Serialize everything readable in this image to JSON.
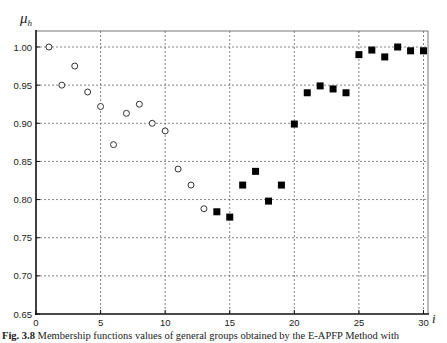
{
  "figure": {
    "caption_label": "Fig. 3.8",
    "caption_text": " Membership functions values of general groups obtained by the E-APFP Method with"
  },
  "chart_data": {
    "type": "scatter",
    "title": "",
    "xlabel": "i",
    "ylabel": "μ",
    "ylabel_subscript": "h",
    "xlim": [
      0,
      30
    ],
    "ylim": [
      0.65,
      1.0
    ],
    "x_ticks": [
      0,
      5,
      10,
      15,
      20,
      25,
      30
    ],
    "x_tick_labels": [
      "0",
      "5",
      "10",
      "15",
      "20",
      "25",
      "30"
    ],
    "y_ticks": [
      0.65,
      0.7,
      0.75,
      0.8,
      0.85,
      0.9,
      0.95,
      1.0
    ],
    "y_tick_labels": [
      "0.65",
      "0.70",
      "0.75",
      "0.80",
      "0.85",
      "0.90",
      "0.95",
      "1.00"
    ],
    "grid": true,
    "legend": null,
    "series": [
      {
        "name": "open circles",
        "marker": "circle-open",
        "color": "#333333",
        "x": [
          1,
          2,
          3,
          4,
          5,
          6,
          7,
          8,
          9,
          10,
          11,
          12,
          13
        ],
        "y": [
          1.0,
          0.95,
          0.975,
          0.941,
          0.922,
          0.872,
          0.913,
          0.925,
          0.9,
          0.89,
          0.84,
          0.819,
          0.788
        ]
      },
      {
        "name": "filled squares",
        "marker": "square-filled",
        "color": "#000000",
        "x": [
          14,
          15,
          16,
          17,
          18,
          19,
          20,
          21,
          22,
          23,
          24,
          25,
          26,
          27,
          28,
          29,
          30
        ],
        "y": [
          0.784,
          0.777,
          0.819,
          0.837,
          0.798,
          0.819,
          0.899,
          0.94,
          0.949,
          0.945,
          0.94,
          0.99,
          0.996,
          0.987,
          1.0,
          0.995,
          0.995
        ]
      }
    ]
  }
}
